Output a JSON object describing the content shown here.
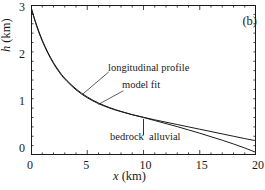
{
  "panel": {
    "label": "(b)"
  },
  "axes": {
    "x": {
      "label_var": "x",
      "label_unit": "(km)",
      "ticks": [
        "0",
        "5",
        "10",
        "15",
        "20"
      ],
      "min": 0,
      "max": 20,
      "minor_step": 1
    },
    "y": {
      "label_var": "h",
      "label_unit": "(km)",
      "ticks": [
        "0",
        "1",
        "2",
        "3"
      ],
      "min": -0.15,
      "max": 3.05,
      "minor_step": 0.2
    }
  },
  "annotations": {
    "longitudinal_profile": "longitudinal profile",
    "model_fit": "model fit",
    "bedrock": "bedrock",
    "alluvial": "alluvial"
  },
  "colors": {
    "line": "#1a1a1a",
    "axis": "#1a1a1a",
    "background": "#ffffff"
  },
  "chart_data": {
    "type": "line",
    "title": "",
    "xlabel": "x (km)",
    "ylabel": "h (km)",
    "xlim": [
      0,
      20
    ],
    "ylim": [
      -0.15,
      3.05
    ],
    "grid": false,
    "legend": "inline-annotations",
    "xticks": [
      0,
      5,
      10,
      15,
      20
    ],
    "yticks": [
      0,
      1,
      2,
      3
    ],
    "xminor_step": 1,
    "yminor_step": 0.2,
    "divider": {
      "label_left": "bedrock",
      "label_right": "alluvial",
      "x": 10,
      "y_top": 0.62,
      "y_bottom": 0.27
    },
    "series": [
      {
        "name": "longitudinal profile",
        "x": [
          0,
          0.5,
          1,
          1.5,
          2,
          2.5,
          3,
          4,
          5,
          6,
          7,
          8,
          9,
          10,
          11,
          12,
          13,
          14,
          15,
          16,
          17,
          18,
          19,
          20
        ],
        "values": [
          3.0,
          2.62,
          2.3,
          2.04,
          1.82,
          1.64,
          1.49,
          1.26,
          1.09,
          0.96,
          0.86,
          0.78,
          0.71,
          0.65,
          0.585,
          0.52,
          0.455,
          0.385,
          0.315,
          0.24,
          0.165,
          0.085,
          0.0,
          -0.095
        ]
      },
      {
        "name": "model fit",
        "x": [
          0,
          0.5,
          1,
          1.5,
          2,
          2.5,
          3,
          4,
          5,
          6,
          7,
          8,
          9,
          10,
          11,
          12,
          13,
          14,
          15,
          16,
          17,
          18,
          19,
          20
        ],
        "values": [
          3.0,
          2.6,
          2.28,
          2.02,
          1.8,
          1.62,
          1.47,
          1.24,
          1.07,
          0.945,
          0.85,
          0.775,
          0.71,
          0.655,
          0.6,
          0.55,
          0.5,
          0.45,
          0.4,
          0.35,
          0.3,
          0.25,
          0.2,
          0.155
        ]
      }
    ]
  }
}
